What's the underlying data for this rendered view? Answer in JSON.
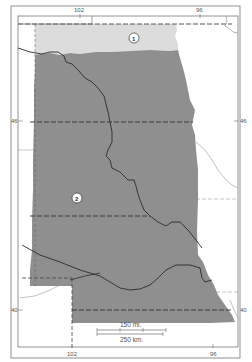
{
  "map": {
    "longitude_labels": {
      "top_left": "102",
      "top_right": "96",
      "bottom_left": "102",
      "bottom_right": "96"
    },
    "latitude_labels": {
      "upper_left": "46",
      "upper_right": "46",
      "lower_left": "40",
      "lower_right": "40"
    },
    "regions": [
      {
        "id": "1",
        "label": "1",
        "shade": "light",
        "color": "#dcdcdc"
      },
      {
        "id": "2",
        "label": "2",
        "shade": "dark",
        "color": "#8f8f8f"
      }
    ],
    "scale_bar": {
      "miles_label": "150 mi.",
      "km_label": "250 km."
    },
    "colors": {
      "frame": "#555555",
      "river": "#2b2b2b",
      "state_border": "#3a3a3a",
      "minor_line": "#9a9a9a"
    }
  }
}
